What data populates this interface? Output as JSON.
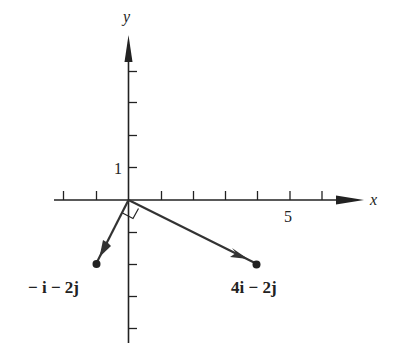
{
  "diagram": {
    "type": "vector-plot",
    "axes": {
      "x_label": "x",
      "y_label": "y",
      "x_tick_label": "5",
      "y_tick_label": "1",
      "x_ticks": [
        -2,
        -1,
        1,
        2,
        3,
        4,
        5,
        6
      ],
      "y_ticks": [
        -4,
        -3,
        -2,
        -1,
        1,
        2,
        3,
        4
      ]
    },
    "vectors": [
      {
        "label": "− i − 2j",
        "x": -1,
        "y": -2
      },
      {
        "label": "4i − 2j",
        "x": 4,
        "y": -2
      }
    ],
    "annotation": "right-angle marker between vectors",
    "colors": {
      "ink": "#222222",
      "background": "#ffffff"
    }
  }
}
